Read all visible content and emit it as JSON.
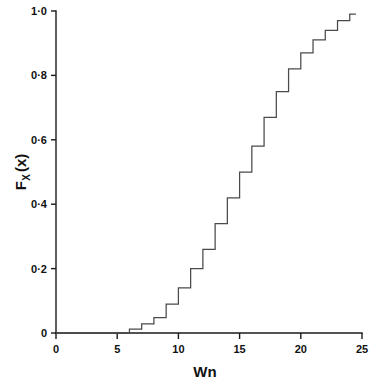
{
  "chart_data": {
    "type": "line",
    "title": "",
    "subtitle": "",
    "xlabel": "Wn",
    "ylabel": "F_X (x)",
    "ylabel_main": "F",
    "ylabel_subscript": "X",
    "ylabel_arg": "(x)",
    "xlim": [
      0,
      25
    ],
    "ylim": [
      0,
      1.0
    ],
    "grid": false,
    "legend": null,
    "legend_position": "none",
    "xticks": [
      0,
      5,
      10,
      15,
      20,
      25
    ],
    "xtick_labels": [
      "0",
      "5",
      "10",
      "15",
      "20",
      "25"
    ],
    "yticks": [
      0,
      0.2,
      0.4,
      0.6,
      0.8,
      1.0
    ],
    "ytick_labels": [
      "0",
      "0·2",
      "0·4",
      "0·6",
      "0·8",
      "1·0"
    ],
    "series": [
      {
        "name": "Empirical CDF of Wn",
        "style": "step-post",
        "color": "#4a4a4a",
        "x": [
          6,
          7,
          8,
          9,
          10,
          11,
          12,
          13,
          14,
          15,
          16,
          17,
          18,
          19,
          20,
          21,
          22,
          23,
          24
        ],
        "values": [
          0.012,
          0.028,
          0.048,
          0.09,
          0.14,
          0.2,
          0.26,
          0.34,
          0.42,
          0.5,
          0.58,
          0.67,
          0.75,
          0.82,
          0.87,
          0.91,
          0.94,
          0.97,
          0.99
        ],
        "x_start": 0,
        "x_end": 24.5,
        "y_start": 0
      }
    ],
    "annotations": []
  },
  "axes": {
    "x_axis_name": "horizontal-axis",
    "y_axis_name": "vertical-axis"
  }
}
